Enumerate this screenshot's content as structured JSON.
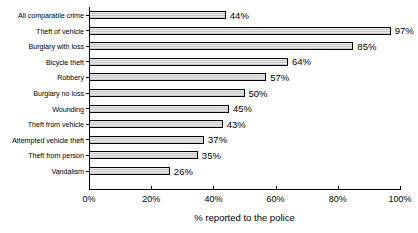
{
  "chart_data": {
    "type": "bar",
    "orientation": "horizontal",
    "title": "",
    "xlabel": "% reported to the police",
    "ylabel": "",
    "xlim": [
      0,
      100
    ],
    "xticks": [
      "0%",
      "20%",
      "40%",
      "60%",
      "80%",
      "100%"
    ],
    "xtick_values": [
      0,
      20,
      40,
      60,
      80,
      100
    ],
    "grid": false,
    "legend": false,
    "value_label_suffix": "%",
    "categories": [
      "All comparable crime",
      "Theft of vehicle",
      "Burglary with loss",
      "Bicycle theft",
      "Robbery",
      "Burglary no loss",
      "Wounding",
      "Theft from vehicle",
      "Attempted vehicle theft",
      "Theft from person",
      "Vandalism"
    ],
    "values": [
      44,
      97,
      85,
      64,
      57,
      50,
      45,
      43,
      37,
      35,
      26
    ],
    "value_labels": [
      "44%",
      "97%",
      "85%",
      "64%",
      "57%",
      "50%",
      "45%",
      "43%",
      "37%",
      "35%",
      "26%"
    ],
    "colors": {
      "bar_fill": "#d2d2d2",
      "bar_edge": "#000000",
      "axis": "#000000",
      "text": "#000000",
      "background": "#ffffff"
    }
  }
}
